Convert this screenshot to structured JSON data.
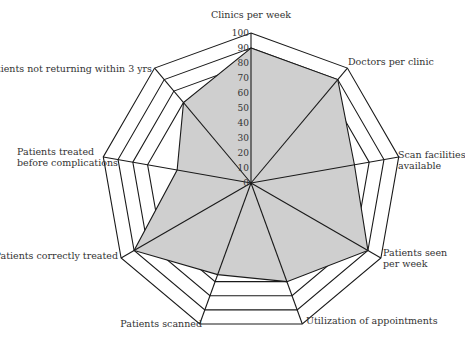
{
  "chart_data": {
    "type": "radar",
    "title": "",
    "axes": [
      {
        "label": [
          "Clinics per week"
        ],
        "value": 90
      },
      {
        "label": [
          "Doctors per clinic"
        ],
        "value": 90
      },
      {
        "label": [
          "Scan facilities",
          "available"
        ],
        "value": 70
      },
      {
        "label": [
          "Patients seen",
          "per week"
        ],
        "value": 90
      },
      {
        "label": [
          "Utilization of appointments"
        ],
        "value": 70
      },
      {
        "label": [
          "Patients scanned"
        ],
        "value": 65
      },
      {
        "label": [
          "Patients correctly treated"
        ],
        "value": 90
      },
      {
        "label": [
          "Patients treated",
          "before complications"
        ],
        "value": 50
      },
      {
        "label": [
          "Patients not returning within 3 yrs"
        ],
        "value": 70
      }
    ],
    "categories": [
      "Clinics per week",
      "Doctors per clinic",
      "Scan facilities available",
      "Patients seen per week",
      "Utilization of appointments",
      "Patients scanned",
      "Patients correctly treated",
      "Patients treated before complications",
      "Patients not returning within 3 yrs"
    ],
    "values": [
      90,
      90,
      70,
      90,
      70,
      65,
      90,
      50,
      70
    ],
    "scale_ticks": [
      "0",
      "10",
      "20",
      "30",
      "40",
      "50",
      "60",
      "70",
      "80",
      "90",
      "100"
    ],
    "rings": [
      70,
      80,
      90,
      100
    ],
    "range": [
      0,
      100
    ],
    "grid": true,
    "legend": "none",
    "colors": {
      "fill": "#cfcfcf",
      "line": "#1a1a1a",
      "text": "#333333"
    }
  }
}
